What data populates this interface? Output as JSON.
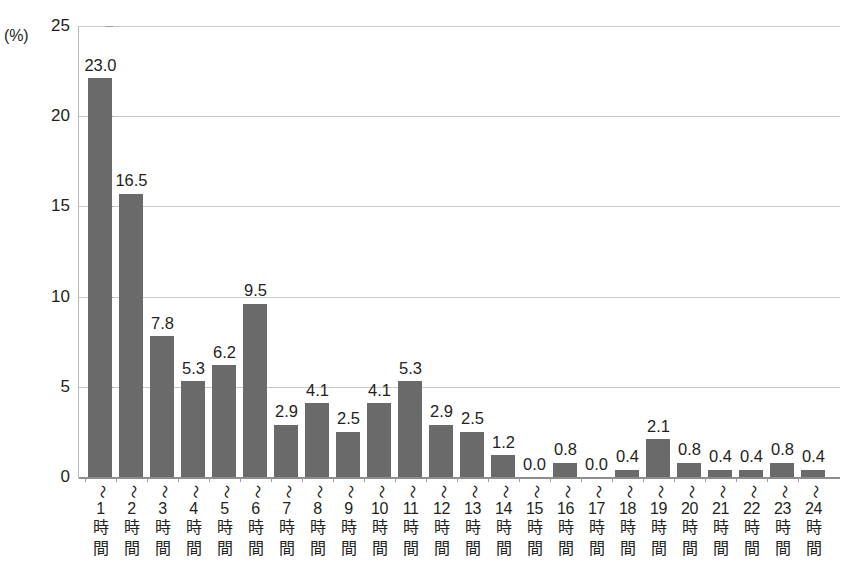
{
  "chart_data": {
    "type": "bar",
    "title": "",
    "subtitle": "",
    "xlabel": "",
    "ylabel": "",
    "unit_label": "(%)",
    "ylim": [
      0,
      25
    ],
    "yticks": [
      0,
      5,
      10,
      15,
      20,
      25
    ],
    "ytick_labels": [
      "0",
      "5",
      "10",
      "15",
      "20",
      "25"
    ],
    "grid": true,
    "grid_axis": "y",
    "legend": "none",
    "bar_color": "#6a6a6a",
    "categories": [
      "〜1時間",
      "〜2時間",
      "〜3時間",
      "〜4時間",
      "〜5時間",
      "〜6時間",
      "〜7時間",
      "〜8時間",
      "〜9時間",
      "〜10時間",
      "〜11時間",
      "〜12時間",
      "〜13時間",
      "〜14時間",
      "〜15時間",
      "〜16時間",
      "〜17時間",
      "〜18時間",
      "〜19時間",
      "〜20時間",
      "〜21時間",
      "〜22時間",
      "〜23時間",
      "〜24時間"
    ],
    "category_parts": [
      {
        "tilde": "〜",
        "num": "1",
        "ji": "時",
        "kan": "間"
      },
      {
        "tilde": "〜",
        "num": "2",
        "ji": "時",
        "kan": "間"
      },
      {
        "tilde": "〜",
        "num": "3",
        "ji": "時",
        "kan": "間"
      },
      {
        "tilde": "〜",
        "num": "4",
        "ji": "時",
        "kan": "間"
      },
      {
        "tilde": "〜",
        "num": "5",
        "ji": "時",
        "kan": "間"
      },
      {
        "tilde": "〜",
        "num": "6",
        "ji": "時",
        "kan": "間"
      },
      {
        "tilde": "〜",
        "num": "7",
        "ji": "時",
        "kan": "間"
      },
      {
        "tilde": "〜",
        "num": "8",
        "ji": "時",
        "kan": "間"
      },
      {
        "tilde": "〜",
        "num": "9",
        "ji": "時",
        "kan": "間"
      },
      {
        "tilde": "〜",
        "num": "10",
        "ji": "時",
        "kan": "間"
      },
      {
        "tilde": "〜",
        "num": "11",
        "ji": "時",
        "kan": "間"
      },
      {
        "tilde": "〜",
        "num": "12",
        "ji": "時",
        "kan": "間"
      },
      {
        "tilde": "〜",
        "num": "13",
        "ji": "時",
        "kan": "間"
      },
      {
        "tilde": "〜",
        "num": "14",
        "ji": "時",
        "kan": "間"
      },
      {
        "tilde": "〜",
        "num": "15",
        "ji": "時",
        "kan": "間"
      },
      {
        "tilde": "〜",
        "num": "16",
        "ji": "時",
        "kan": "間"
      },
      {
        "tilde": "〜",
        "num": "17",
        "ji": "時",
        "kan": "間"
      },
      {
        "tilde": "〜",
        "num": "18",
        "ji": "時",
        "kan": "間"
      },
      {
        "tilde": "〜",
        "num": "19",
        "ji": "時",
        "kan": "間"
      },
      {
        "tilde": "〜",
        "num": "20",
        "ji": "時",
        "kan": "間"
      },
      {
        "tilde": "〜",
        "num": "21",
        "ji": "時",
        "kan": "間"
      },
      {
        "tilde": "〜",
        "num": "22",
        "ji": "時",
        "kan": "間"
      },
      {
        "tilde": "〜",
        "num": "23",
        "ji": "時",
        "kan": "間"
      },
      {
        "tilde": "〜",
        "num": "24",
        "ji": "時",
        "kan": "間"
      }
    ],
    "values": [
      23.0,
      16.5,
      7.8,
      5.3,
      6.2,
      9.5,
      2.9,
      4.1,
      2.5,
      4.1,
      5.3,
      2.9,
      2.5,
      1.2,
      0.0,
      0.8,
      0.0,
      0.4,
      2.1,
      0.8,
      0.4,
      0.4,
      0.8,
      0.4
    ],
    "value_labels": [
      "23.0",
      "16.5",
      "7.8",
      "5.3",
      "6.2",
      "9.5",
      "2.9",
      "4.1",
      "2.5",
      "4.1",
      "5.3",
      "2.9",
      "2.5",
      "1.2",
      "0.0",
      "0.8",
      "0.0",
      "0.4",
      "2.1",
      "0.8",
      "0.4",
      "0.4",
      "0.8",
      "0.4"
    ],
    "drawn_heights": [
      22.1,
      15.7,
      7.8,
      5.3,
      6.2,
      9.6,
      2.9,
      4.1,
      2.5,
      4.1,
      5.3,
      2.9,
      2.5,
      1.2,
      0.0,
      0.8,
      0.0,
      0.4,
      2.1,
      0.8,
      0.4,
      0.4,
      0.8,
      0.4
    ]
  }
}
